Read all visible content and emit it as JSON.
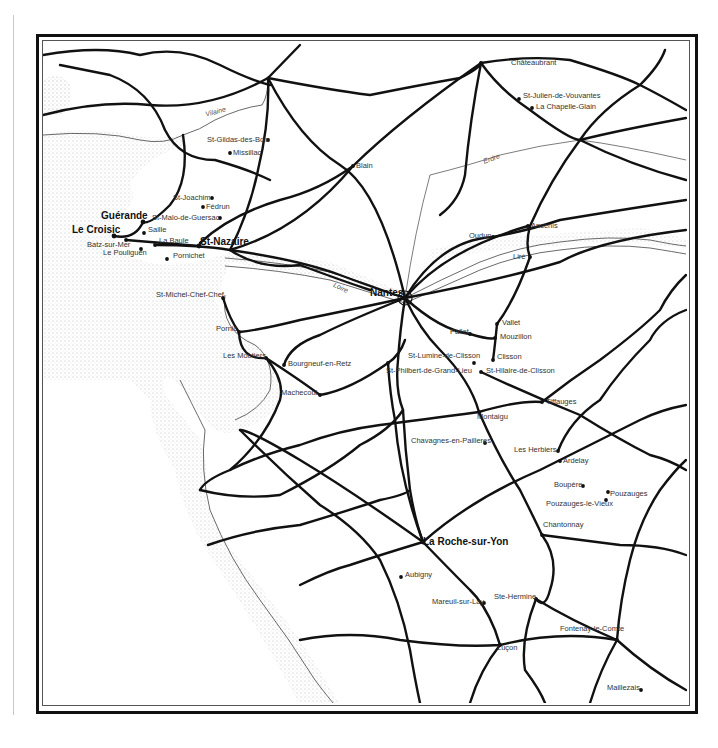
{
  "map": {
    "rivers": [
      {
        "name": "Vilaine",
        "x": 205,
        "y": 108,
        "rot": -15
      },
      {
        "name": "Erdre",
        "x": 483,
        "y": 155,
        "rot": -20
      },
      {
        "name": "Loire",
        "x": 333,
        "y": 284,
        "rot": 25
      }
    ],
    "places": [
      {
        "name": "Châteaubrant",
        "x": 511,
        "y": 63,
        "dot": [
          481,
          63
        ],
        "bold": false
      },
      {
        "name": "St-Julien-de-Vouvantes",
        "x": 523,
        "y": 96,
        "dot": [
          519,
          99
        ],
        "bold": false
      },
      {
        "name": "La Chapelle-Glain",
        "x": 536,
        "y": 107,
        "dot": [
          532,
          108
        ],
        "bold": false
      },
      {
        "name": "St-Gildas-des-Bois",
        "x": 207,
        "y": 140,
        "dot": [
          268,
          140
        ],
        "bold": false
      },
      {
        "name": "Missillac",
        "x": 233,
        "y": 153,
        "dot": [
          230,
          153
        ],
        "bold": false
      },
      {
        "name": "Blain",
        "x": 356,
        "y": 166,
        "dot": [
          353,
          166
        ],
        "bold": false
      },
      {
        "name": "St-Joachim",
        "x": 173,
        "y": 198,
        "dot": [
          212,
          198
        ],
        "bold": false
      },
      {
        "name": "Fédrun",
        "x": 206,
        "y": 207,
        "dot": [
          203,
          207
        ],
        "bold": false
      },
      {
        "name": "St-Malo-de-Guersac",
        "x": 152,
        "y": 218,
        "dot": [
          220,
          218
        ],
        "bold": false
      },
      {
        "name": "Guérande",
        "x": 101,
        "y": 217,
        "dot": [
          143,
          222
        ],
        "bold": true
      },
      {
        "name": "Le Croisic",
        "x": 72,
        "y": 231,
        "dot": [
          114,
          236
        ],
        "bold": true
      },
      {
        "name": "Saille",
        "x": 148,
        "y": 230,
        "dot": [
          144,
          233
        ],
        "bold": false
      },
      {
        "name": "Batz-sur-Mer",
        "x": 87,
        "y": 245,
        "dot": [
          126,
          240
        ],
        "bold": false
      },
      {
        "name": "Le Pouliguen",
        "x": 103,
        "y": 253,
        "dot": [
          141,
          249
        ],
        "bold": false
      },
      {
        "name": "La Baule",
        "x": 159,
        "y": 241,
        "dot": [
          155,
          245
        ],
        "bold": false
      },
      {
        "name": "Pornichet",
        "x": 173,
        "y": 256,
        "dot": [
          167,
          259
        ],
        "bold": false
      },
      {
        "name": "St-Nazaire",
        "x": 200,
        "y": 243,
        "dot": [
          199,
          246
        ],
        "bold": true
      },
      {
        "name": "Ancenis",
        "x": 531,
        "y": 226,
        "dot": [
          528,
          226
        ],
        "bold": false
      },
      {
        "name": "Oudun",
        "x": 469,
        "y": 236,
        "dot": [
          493,
          237
        ],
        "bold": false
      },
      {
        "name": "Liré",
        "x": 513,
        "y": 257,
        "dot": [
          530,
          257
        ],
        "bold": false
      },
      {
        "name": "St-Michel-Chef-Chef",
        "x": 156,
        "y": 295,
        "dot": [
          223,
          298
        ],
        "bold": false
      },
      {
        "name": "Nantes",
        "x": 370,
        "y": 294,
        "dot": [
          405,
          298
        ],
        "bold": true
      },
      {
        "name": "Pornic",
        "x": 216,
        "y": 329,
        "dot": [
          239,
          332
        ],
        "bold": false
      },
      {
        "name": "Vallet",
        "x": 502,
        "y": 323,
        "dot": [
          497,
          324
        ],
        "bold": false
      },
      {
        "name": "Pallet",
        "x": 450,
        "y": 332,
        "dot": [
          470,
          334
        ],
        "bold": false
      },
      {
        "name": "Mouzillon",
        "x": 500,
        "y": 337,
        "dot": [
          495,
          338
        ],
        "bold": false
      },
      {
        "name": "Les Moutiers",
        "x": 223,
        "y": 356,
        "dot": [
          266,
          358
        ],
        "bold": false
      },
      {
        "name": "St-Lumine-de-Clisson",
        "x": 408,
        "y": 356,
        "dot": [
          474,
          363
        ],
        "bold": false
      },
      {
        "name": "Clisson",
        "x": 497,
        "y": 357,
        "dot": [
          493,
          360
        ],
        "bold": false
      },
      {
        "name": "Bourgneuf-en-Retz",
        "x": 288,
        "y": 364,
        "dot": [
          284,
          365
        ],
        "bold": false
      },
      {
        "name": "St-Philbert-de-Grand-Lieu",
        "x": 386,
        "y": 371,
        "dot": [
          388,
          363
        ],
        "bold": false
      },
      {
        "name": "St-Hilaire-de-Clisson",
        "x": 486,
        "y": 371,
        "dot": [
          481,
          372
        ],
        "bold": false
      },
      {
        "name": "Machecoul",
        "x": 281,
        "y": 393,
        "dot": [
          320,
          395
        ],
        "bold": false
      },
      {
        "name": "Tiffauges",
        "x": 546,
        "y": 402,
        "dot": [
          542,
          402
        ],
        "bold": false
      },
      {
        "name": "Montaigu",
        "x": 477,
        "y": 417,
        "dot": [
          479,
          412
        ],
        "bold": false
      },
      {
        "name": "Chavagnes-en-Pailleres",
        "x": 411,
        "y": 441,
        "dot": [
          485,
          443
        ],
        "bold": false
      },
      {
        "name": "Les Herbiers",
        "x": 514,
        "y": 450,
        "dot": [
          558,
          451
        ],
        "bold": false
      },
      {
        "name": "Ardelay",
        "x": 563,
        "y": 461,
        "dot": [
          560,
          461
        ],
        "bold": false
      },
      {
        "name": "Boupère",
        "x": 554,
        "y": 485,
        "dot": [
          583,
          486
        ],
        "bold": false
      },
      {
        "name": "Pouzauges",
        "x": 610,
        "y": 494,
        "dot": [
          608,
          492
        ],
        "bold": false
      },
      {
        "name": "Pouzauges-le-Vieux",
        "x": 546,
        "y": 504,
        "dot": [
          606,
          500
        ],
        "bold": false
      },
      {
        "name": "Chantonnay",
        "x": 543,
        "y": 525,
        "dot": [
          542,
          535
        ],
        "bold": false
      },
      {
        "name": "La Roche-sur-Yon",
        "x": 423,
        "y": 543,
        "dot": [
          423,
          542
        ],
        "bold": true
      },
      {
        "name": "Aubigny",
        "x": 405,
        "y": 575,
        "dot": [
          401,
          577
        ],
        "bold": false
      },
      {
        "name": "Ste-Hermine",
        "x": 494,
        "y": 597,
        "dot": [
          536,
          599
        ],
        "bold": false
      },
      {
        "name": "Mareuil-sur-Lay",
        "x": 432,
        "y": 602,
        "dot": [
          484,
          603
        ],
        "bold": false
      },
      {
        "name": "Fontenay-le-Comte",
        "x": 560,
        "y": 629,
        "dot": [
          617,
          640
        ],
        "bold": false
      },
      {
        "name": "Luçon",
        "x": 497,
        "y": 648,
        "dot": [
          500,
          645
        ],
        "bold": false
      },
      {
        "name": "Maillezais",
        "x": 607,
        "y": 688,
        "dot": [
          641,
          690
        ],
        "bold": false
      }
    ]
  }
}
